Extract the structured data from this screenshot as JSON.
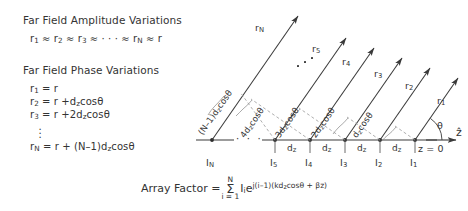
{
  "left_panel": {
    "amplitude": {
      "heading": "Far Field Amplitude Variations",
      "relation_parts": {
        "r1": "r",
        "s1": "1",
        "approx1": "≈",
        "r2": "r",
        "s2": "2",
        "approx2": "≈",
        "r3": "r",
        "s3": "3",
        "approx3": "≈",
        "ellipsis": "· · ·",
        "approx4": "≈",
        "rN": "r",
        "sN": "N",
        "approx5": "≈",
        "r": "r"
      }
    },
    "phase": {
      "heading": "Far Field Phase Variations",
      "equations": [
        {
          "lhs": "r",
          "lhs_sub": "1",
          "rhs": "= r"
        },
        {
          "lhs": "r",
          "lhs_sub": "2",
          "rhs": "= r +d",
          "rhs_sub": "z",
          "rhs_tail": "cosθ"
        },
        {
          "lhs": "r",
          "lhs_sub": "3",
          "rhs": "= r +2d",
          "rhs_sub": "z",
          "rhs_tail": "cosθ"
        },
        {
          "lhs": "r",
          "lhs_sub": "N",
          "rhs": "= r + (N–1)d",
          "rhs_sub": "z",
          "rhs_tail": "cosθ"
        }
      ],
      "vertical_dots": "⋮"
    }
  },
  "diagram": {
    "axis_label": "ẑ",
    "origin_label": "z = 0",
    "angle_label": "θ",
    "ray_labels": [
      {
        "base": "r",
        "sub": "1"
      },
      {
        "base": "r",
        "sub": "2"
      },
      {
        "base": "r",
        "sub": "3"
      },
      {
        "base": "r",
        "sub": "4"
      },
      {
        "base": "r",
        "sub": "5"
      },
      {
        "base": "r",
        "sub": "N"
      }
    ],
    "element_labels": [
      {
        "base": "I",
        "sub": "1"
      },
      {
        "base": "I",
        "sub": "2"
      },
      {
        "base": "I",
        "sub": "3"
      },
      {
        "base": "I",
        "sub": "4"
      },
      {
        "base": "I",
        "sub": "5"
      },
      {
        "base": "I",
        "sub": "N"
      }
    ],
    "spacing_label": {
      "base": "d",
      "sub": "z"
    },
    "spacing_count": 4,
    "path_difference_labels": [
      {
        "prefix": "d",
        "sub": "z",
        "tail": "cosθ"
      },
      {
        "prefix": "2d",
        "sub": "z",
        "tail": "cosθ"
      },
      {
        "prefix": "3d",
        "sub": "z",
        "tail": "cosθ"
      },
      {
        "prefix": "4d",
        "sub": "z",
        "tail": "cosθ"
      },
      {
        "prefix": "(N–1)d",
        "sub": "z",
        "tail": "cosθ"
      }
    ],
    "ray_ellipsis": "· · ·",
    "axis_ellipsis": "· · ·",
    "colors": {
      "line": "#3a3a3a",
      "dash": "#8a8a8a",
      "text": "#333333"
    }
  },
  "formula": {
    "label": "Array Factor",
    "equals": "=",
    "sum_upper": "N",
    "sum_symbol": "Σ",
    "sum_lower": "i = 1",
    "term_I": "I",
    "term_I_sub": "i",
    "term_e": "e",
    "exponent_main": "j(i–1)(kd",
    "exponent_sub": "z",
    "exponent_tail": "cosθ + βz)"
  }
}
